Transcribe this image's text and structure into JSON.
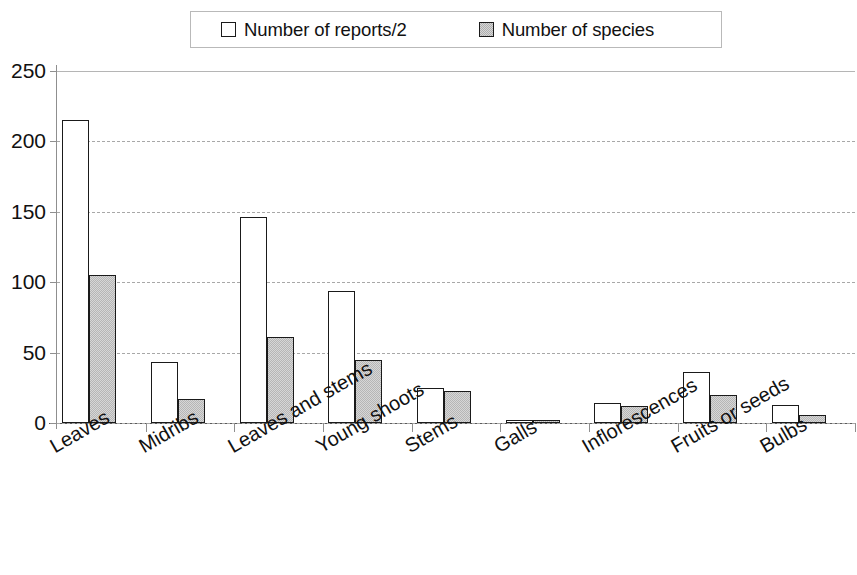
{
  "chart_data": {
    "type": "bar",
    "title": "",
    "subtitle": "",
    "xlabel": "",
    "ylabel": "",
    "ylim": [
      0,
      250
    ],
    "yticks": [
      0,
      50,
      100,
      150,
      200,
      250
    ],
    "grid": true,
    "legend_position": "top",
    "categories": [
      "Leaves",
      "Midribs",
      "Leaves and stems",
      "Young shoots",
      "Stems",
      "Galls",
      "Inflorescences",
      "Fruits or seeds",
      "Bulbs"
    ],
    "series": [
      {
        "name": "Number of reports/2",
        "style": "open",
        "color": "#ffffff",
        "border": "#1a1a1a",
        "values": [
          215,
          43,
          146,
          94,
          25,
          2,
          14,
          36,
          13
        ]
      },
      {
        "name": "Number of species",
        "style": "filled",
        "color": "#d7d7d7",
        "border": "#1a1a1a",
        "values": [
          105,
          17,
          61,
          45,
          23,
          2,
          12,
          20,
          6
        ]
      }
    ]
  },
  "legend": {
    "entries": [
      {
        "label": "Number of reports/2",
        "swatch": "open-square-swatch"
      },
      {
        "label": "Number of species",
        "swatch": "filled-square-swatch"
      }
    ]
  },
  "axis": {
    "y_tick_labels": [
      "250",
      "200",
      "150",
      "100",
      "50",
      "0"
    ]
  }
}
